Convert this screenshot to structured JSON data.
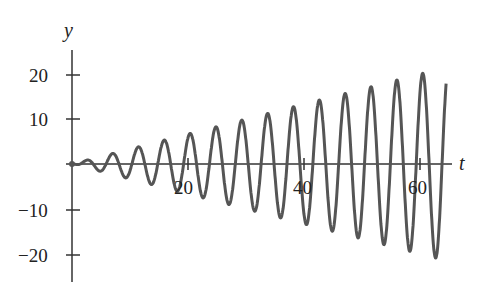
{
  "chart_data": {
    "type": "line",
    "title": "",
    "xlabel": "t",
    "ylabel": "y",
    "xlim": [
      0,
      66
    ],
    "ylim": [
      -25,
      25
    ],
    "x_ticks": [
      20,
      40,
      60
    ],
    "x_tick_labels": [
      "20",
      "40",
      "60"
    ],
    "y_ticks": [
      20,
      10,
      -10,
      -20
    ],
    "y_tick_labels": [
      "20",
      "10",
      "−10",
      "−20"
    ],
    "grid": false,
    "legend": null,
    "series": [
      {
        "name": "y(t)",
        "description": "oscillation with linearly growing amplitude, approx y = (t/3)·sin(1.4t)",
        "color": "#555555",
        "amplitude_envelope": {
          "t": [
            0,
            10,
            20,
            30,
            40,
            50,
            60,
            64.5
          ],
          "amp": [
            0,
            3,
            6.5,
            10,
            13.5,
            17,
            20.5,
            22
          ]
        },
        "peaks_t": [
          22.2,
          26.7,
          31.1,
          35.6,
          40.1,
          44.5,
          49.0,
          53.5,
          57.9,
          62.4
        ],
        "peaks_y": [
          6.6,
          8.3,
          9.9,
          11.5,
          13.2,
          14.8,
          16.4,
          18.0,
          19.6,
          21.5
        ],
        "t_end": 64.5,
        "y_end": 3.5
      }
    ]
  },
  "labels": {
    "y_axis": "y",
    "t_axis": "t",
    "tick_20": "20",
    "tick_10": "10",
    "tick_m10": "−10",
    "tick_m20": "−20",
    "tick_t20": "20",
    "tick_t40": "40",
    "tick_t60": "60"
  }
}
